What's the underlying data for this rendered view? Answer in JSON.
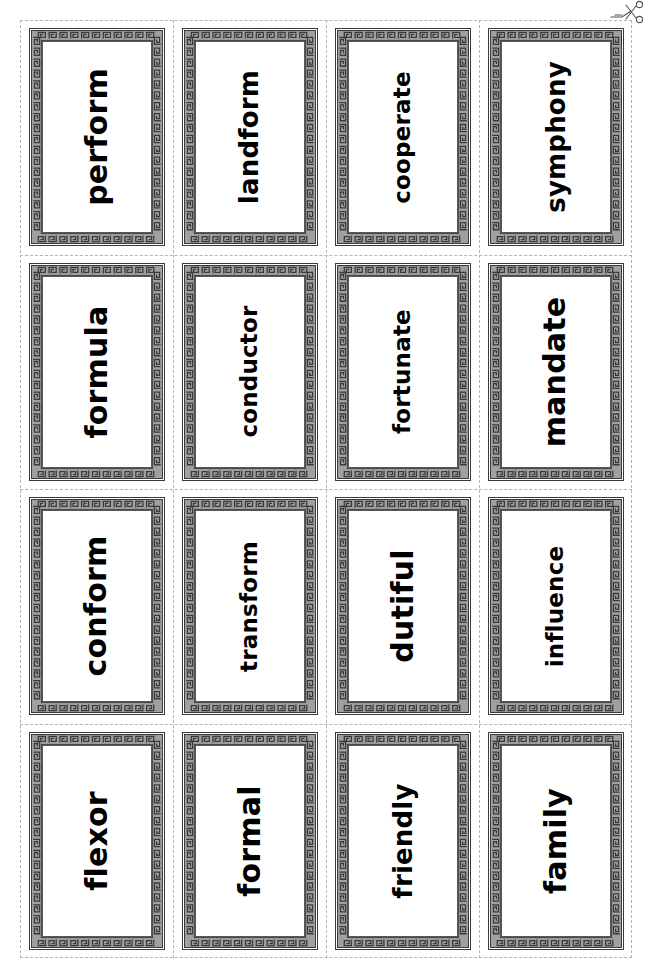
{
  "page": {
    "background_color": "#ffffff",
    "cut_line_color": "#b4b4b4",
    "border_band_color": "#a0a0a0",
    "border_key_color": "#3a3a3a",
    "text_color": "#000000",
    "columns": 4,
    "rows": 4
  },
  "marks": {
    "scissors_icon": "scissors-icon"
  },
  "cards": [
    {
      "word": "perform"
    },
    {
      "word": "landform"
    },
    {
      "word": "cooperate"
    },
    {
      "word": "symphony"
    },
    {
      "word": "formula"
    },
    {
      "word": "conductor"
    },
    {
      "word": "fortunate"
    },
    {
      "word": "mandate"
    },
    {
      "word": "conform"
    },
    {
      "word": "transform"
    },
    {
      "word": "dutiful"
    },
    {
      "word": "influence"
    },
    {
      "word": "flexor"
    },
    {
      "word": "formal"
    },
    {
      "word": "friendly"
    },
    {
      "word": "family"
    }
  ]
}
